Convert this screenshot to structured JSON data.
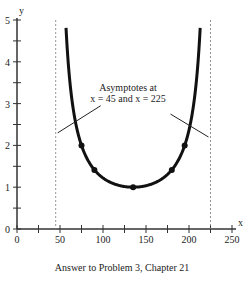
{
  "chart_data": {
    "type": "line",
    "title": "",
    "caption": "Answer to Problem 3, Chapter 21",
    "xlabel": "x",
    "ylabel": "y",
    "xlim": [
      0,
      250
    ],
    "ylim": [
      0,
      5
    ],
    "x_ticks": [
      0,
      50,
      100,
      150,
      200,
      250
    ],
    "y_ticks": [
      0,
      1,
      2,
      3,
      4,
      5
    ],
    "grid": false,
    "function": "y = 1 / sin((x - 45) * 180/180 degrees) (cosecant-shaped curve)",
    "asymptotes": [
      45,
      225
    ],
    "annotation": {
      "line1": "Asymptotes at",
      "line2": "x = 45 and x = 225"
    },
    "marked_points": [
      {
        "x": 75,
        "y": 2
      },
      {
        "x": 90,
        "y": 1.41
      },
      {
        "x": 135,
        "y": 1
      },
      {
        "x": 180,
        "y": 1.41
      },
      {
        "x": 195,
        "y": 2
      }
    ]
  }
}
